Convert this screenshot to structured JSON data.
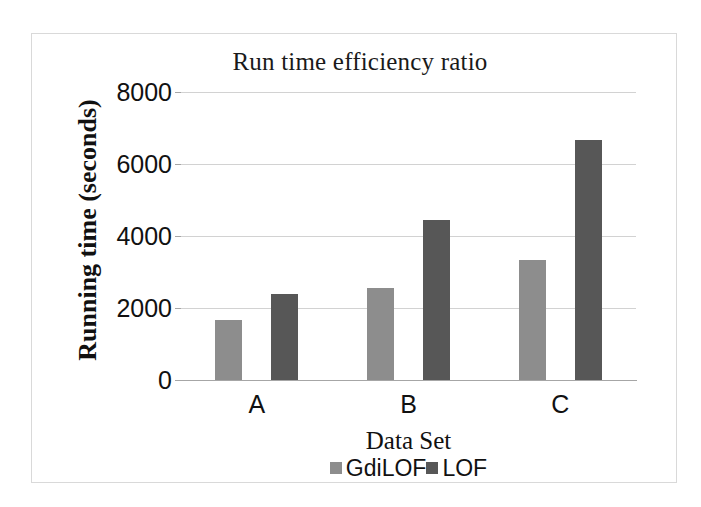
{
  "chart_data": {
    "type": "bar",
    "title": "Run time efficiency ratio",
    "xlabel": "Data Set",
    "ylabel": "Running time (seconds)",
    "categories": [
      "A",
      "B",
      "C"
    ],
    "series": [
      {
        "name": "GdiLOF",
        "color": "#8d8d8d",
        "values": [
          1667,
          2556,
          3333
        ]
      },
      {
        "name": "LOF",
        "color": "#575757",
        "values": [
          2389,
          4444,
          6667
        ]
      }
    ],
    "ylim": [
      0,
      8000
    ],
    "yticks": [
      0,
      2000,
      4000,
      6000,
      8000
    ],
    "ytick_labels": [
      "0",
      "2000",
      "4000",
      "6000",
      "8000"
    ],
    "grid": true,
    "legend_position": "bottom"
  },
  "axis": {
    "y_ticks": [
      {
        "label": "8000",
        "value": 8000
      },
      {
        "label": "6000",
        "value": 6000
      },
      {
        "label": "4000",
        "value": 4000
      },
      {
        "label": "2000",
        "value": 2000
      },
      {
        "label": "0",
        "value": 0
      }
    ],
    "x_ticks": [
      {
        "label": "A"
      },
      {
        "label": "B"
      },
      {
        "label": "C"
      }
    ]
  },
  "legend": {
    "items": [
      {
        "label": "GdiLOF",
        "color": "#8d8d8d"
      },
      {
        "label": "LOF",
        "color": "#575757"
      }
    ]
  },
  "colors": {
    "series_0": "#8d8d8d",
    "series_1": "#575757",
    "gridline": "#d2d2d2",
    "axis": "#a6a6a6",
    "frame_border": "#d9d9d9",
    "text": "#111111",
    "background": "#ffffff"
  }
}
